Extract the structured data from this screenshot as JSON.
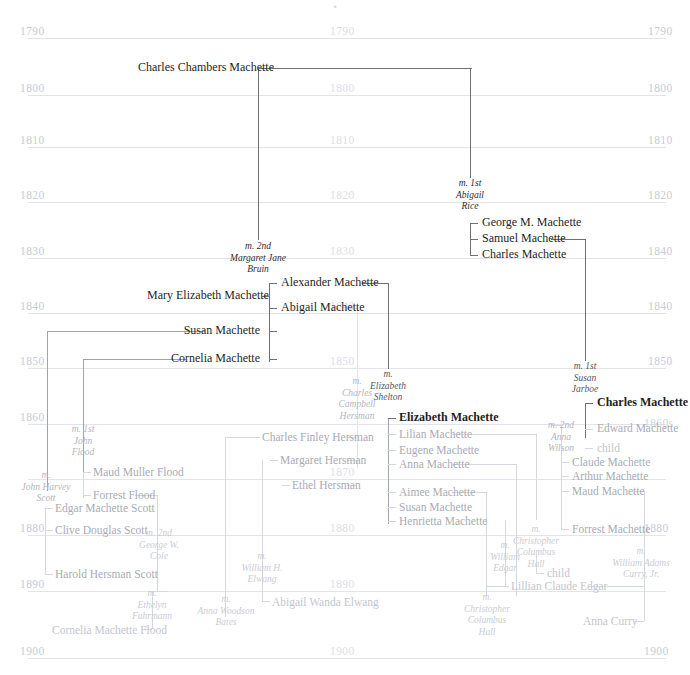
{
  "chart": {
    "type": "genealogy-timeline",
    "width": 690,
    "height": 675
  },
  "timeline": {
    "columns": [
      "left",
      "center",
      "right"
    ],
    "rows": [
      {
        "y": 30,
        "left": "1790",
        "center": "1790",
        "right": "1790"
      },
      {
        "y": 87,
        "left": "1800",
        "center": "1800",
        "right": "1800"
      },
      {
        "y": 139,
        "left": "1810",
        "center": "1810",
        "right": "1810"
      },
      {
        "y": 194,
        "left": "1820",
        "center": "1820",
        "right": "1820"
      },
      {
        "y": 250,
        "left": "1830",
        "center": "1830",
        "right": "1840"
      },
      {
        "y": 305,
        "left": "1840",
        "center": "1840",
        "right": "1840"
      },
      {
        "y": 360,
        "left": "1850",
        "center": "1850",
        "right": "1850"
      },
      {
        "y": 416,
        "left": "1860",
        "center": "1860",
        "right": "1860s"
      },
      {
        "y": 471,
        "left": "1870",
        "center": "1870",
        "right": "1870"
      },
      {
        "y": 527,
        "left": "1880",
        "center": "1880",
        "right": "1880"
      },
      {
        "y": 583,
        "left": "1890",
        "center": "1890",
        "right": "1890"
      },
      {
        "y": 650,
        "left": "1900",
        "center": "1900",
        "right": "1900"
      }
    ]
  },
  "people": [
    {
      "id": "p01",
      "name": "Charles Chambers Machette",
      "gen": 1
    },
    {
      "id": "p02",
      "name": "George M. Machette",
      "gen": 2
    },
    {
      "id": "p03",
      "name": "Samuel Machette",
      "gen": 2
    },
    {
      "id": "p04",
      "name": "Charles Machette",
      "gen": 2
    },
    {
      "id": "p05",
      "name": "Alexander Machette",
      "gen": 2
    },
    {
      "id": "p06",
      "name": "Mary Elizabeth Machette",
      "gen": 2
    },
    {
      "id": "p07",
      "name": "Abigail Machette",
      "gen": 2
    },
    {
      "id": "p08",
      "name": "Susan Machette",
      "gen": 2
    },
    {
      "id": "p09",
      "name": "Cornelia Machette",
      "gen": 2
    },
    {
      "id": "p10",
      "name": "Charles Machette",
      "gen": 3
    },
    {
      "id": "p11",
      "name": "Edward Machette",
      "gen": 3
    },
    {
      "id": "p12",
      "name": "child",
      "gen": 3
    },
    {
      "id": "p13",
      "name": "Elizabeth Machette",
      "gen": 3
    },
    {
      "id": "p14",
      "name": "Lilian Machette",
      "gen": 3
    },
    {
      "id": "p15",
      "name": "Eugene Machette",
      "gen": 3
    },
    {
      "id": "p16",
      "name": "Anna Machette",
      "gen": 3
    },
    {
      "id": "p17",
      "name": "Aimee Machette",
      "gen": 3
    },
    {
      "id": "p18",
      "name": "Susan Machette",
      "gen": 3
    },
    {
      "id": "p19",
      "name": "Henrietta Machette",
      "gen": 3
    },
    {
      "id": "p20",
      "name": "Claude Machette",
      "gen": 3
    },
    {
      "id": "p21",
      "name": "Arthur Machette",
      "gen": 3
    },
    {
      "id": "p22",
      "name": "Maud Machette",
      "gen": 3
    },
    {
      "id": "p23",
      "name": "Forrest Machette",
      "gen": 3
    },
    {
      "id": "p24",
      "name": "Maud Muller Flood",
      "gen": 3
    },
    {
      "id": "p25",
      "name": "Forrest Flood",
      "gen": 3
    },
    {
      "id": "p26",
      "name": "Edgar Machette Scott",
      "gen": 3
    },
    {
      "id": "p27",
      "name": "Clive Douglas Scott",
      "gen": 3
    },
    {
      "id": "p28",
      "name": "Harold Hersman Scott",
      "gen": 3
    },
    {
      "id": "p29",
      "name": "Charles Finley Hersman",
      "gen": 3
    },
    {
      "id": "p30",
      "name": "Margaret Hersman",
      "gen": 3
    },
    {
      "id": "p31",
      "name": "Ethel Hersman",
      "gen": 3
    },
    {
      "id": "p32",
      "name": "Cornelia Machette Flood",
      "gen": 4
    },
    {
      "id": "p33",
      "name": "Abigail Wanda Elwang",
      "gen": 4
    },
    {
      "id": "p34",
      "name": "Lillian Claude Edgar",
      "gen": 4
    },
    {
      "id": "p35",
      "name": "Anna Curry",
      "gen": 4
    },
    {
      "id": "p36",
      "name": "child",
      "gen": 4
    },
    {
      "id": "p37",
      "name": "child",
      "gen": 4
    }
  ],
  "marriages": [
    {
      "id": "m01",
      "prefix": "m. 1st",
      "lines": [
        "Abigail",
        "Rice"
      ]
    },
    {
      "id": "m02",
      "prefix": "m. 2nd",
      "lines": [
        "Margaret Jane",
        "Bruin"
      ]
    },
    {
      "id": "m03",
      "prefix": "m. 1st",
      "lines": [
        "Susan",
        "Jarboe"
      ]
    },
    {
      "id": "m04",
      "prefix": "m. 2nd",
      "lines": [
        "Anna",
        "Wilson"
      ]
    },
    {
      "id": "m05",
      "prefix": "m.",
      "lines": [
        "Elizabeth",
        "Shelton"
      ]
    },
    {
      "id": "m06",
      "prefix": "m.",
      "lines": [
        "Charles",
        "Campbell",
        "Hersman"
      ]
    },
    {
      "id": "m07",
      "prefix": "m. 1st",
      "lines": [
        "John",
        "Flood"
      ]
    },
    {
      "id": "m08",
      "prefix": "m. 2nd",
      "lines": [
        "George W.",
        "Cole"
      ]
    },
    {
      "id": "m09",
      "prefix": "m.",
      "lines": [
        "John Harvey",
        "Scott"
      ]
    },
    {
      "id": "m10",
      "prefix": "m.",
      "lines": [
        "William H.",
        "Elwang"
      ]
    },
    {
      "id": "m11",
      "prefix": "m.",
      "lines": [
        "Ethelyn",
        "Fuhrmann"
      ]
    },
    {
      "id": "m12",
      "prefix": "m.",
      "lines": [
        "Anna Woodson",
        "Bates"
      ]
    },
    {
      "id": "m13",
      "prefix": "m.",
      "lines": [
        "William",
        "Edgar"
      ]
    },
    {
      "id": "m14",
      "prefix": "m.",
      "lines": [
        "Christopher",
        "Columbus",
        "Hall"
      ]
    },
    {
      "id": "m15",
      "prefix": "m.",
      "lines": [
        "Christopher",
        "Columbus",
        "Hall"
      ]
    },
    {
      "id": "m16",
      "prefix": "m.",
      "lines": [
        "William Adams",
        "Curry, Jr."
      ]
    }
  ],
  "colors": {
    "background": "#ffffff",
    "gridline": "#e3e4ea",
    "year_label": "#c9cbd4",
    "line_dark": "#6d7078",
    "line_mid": "#9fa3ad",
    "line_faint": "#d6d8df",
    "text_dark": "#1d1f24",
    "text_faint": "#c3c6ce"
  }
}
